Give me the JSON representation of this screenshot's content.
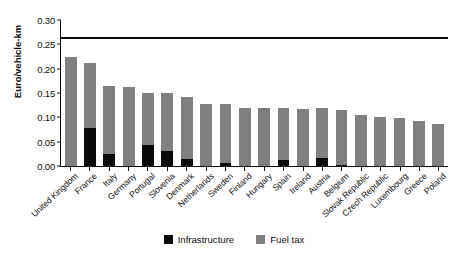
{
  "chart_data": {
    "type": "bar",
    "stacked": true,
    "title": "",
    "xlabel": "",
    "ylabel": "Euro/vehicle-km",
    "ylim": [
      0.0,
      0.3
    ],
    "ytick_labels": [
      "0.30",
      "0.25",
      "0.20",
      "0.15",
      "0.10",
      "0.05",
      "0.00"
    ],
    "ytick_values": [
      0.3,
      0.25,
      0.2,
      0.15,
      0.1,
      0.05,
      0.0
    ],
    "grid": false,
    "legend_position": "bottom-center",
    "reference_line": {
      "value": 0.265,
      "label": "",
      "color": "#0a0a0a"
    },
    "categories": [
      "United Kingdom",
      "France",
      "Italy",
      "Germany",
      "Portugal",
      "Slovenia",
      "Denmark",
      "Netherlands",
      "Sweden",
      "Finland",
      "Hungary",
      "Spain",
      "Ireland",
      "Austria",
      "Belgium",
      "Slovak Republic",
      "Czech Republic",
      "Luxembourg",
      "Greece",
      "Poland"
    ],
    "series": [
      {
        "name": "Infrastructure",
        "color": "#0a0a0a",
        "values": [
          0.0,
          0.078,
          0.024,
          0.0,
          0.044,
          0.03,
          0.014,
          0.0,
          0.006,
          0.0,
          0.0,
          0.012,
          0.0,
          0.016,
          0.003,
          0.0,
          0.0,
          0.0,
          0.0,
          0.0
        ]
      },
      {
        "name": "Fuel tax",
        "color": "#808080",
        "values": [
          0.225,
          0.133,
          0.14,
          0.162,
          0.107,
          0.121,
          0.128,
          0.127,
          0.121,
          0.12,
          0.119,
          0.107,
          0.117,
          0.103,
          0.113,
          0.104,
          0.1,
          0.098,
          0.093,
          0.086
        ]
      }
    ],
    "totals": [
      0.225,
      0.211,
      0.164,
      0.162,
      0.151,
      0.151,
      0.142,
      0.127,
      0.127,
      0.12,
      0.119,
      0.119,
      0.117,
      0.119,
      0.116,
      0.104,
      0.1,
      0.098,
      0.093,
      0.086
    ]
  },
  "legend": {
    "items": [
      {
        "label": "Infrastructure"
      },
      {
        "label": "Fuel tax"
      }
    ]
  },
  "axis": {
    "y_title": "Euro/vehicle-km"
  }
}
